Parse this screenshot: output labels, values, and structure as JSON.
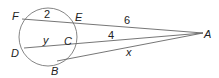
{
  "diagram": {
    "type": "circle-secants-tangent",
    "points": {
      "F": {
        "label": "F",
        "x": 22,
        "y": 19
      },
      "E": {
        "label": "E",
        "x": 74,
        "y": 23
      },
      "D": {
        "label": "D",
        "x": 24,
        "y": 48
      },
      "C": {
        "label": "C",
        "x": 76,
        "y": 43
      },
      "B": {
        "label": "B",
        "x": 57,
        "y": 61
      },
      "A": {
        "label": "A",
        "x": 203,
        "y": 33
      }
    },
    "circle": {
      "cx": 48,
      "cy": 37,
      "r": 29
    },
    "segments": {
      "FE": {
        "label": "2"
      },
      "EA": {
        "label": "6"
      },
      "DC": {
        "label": "y"
      },
      "CA": {
        "label": "4"
      },
      "BA": {
        "label": "x"
      }
    },
    "colors": {
      "stroke": "#666666",
      "text": "#222222"
    }
  }
}
